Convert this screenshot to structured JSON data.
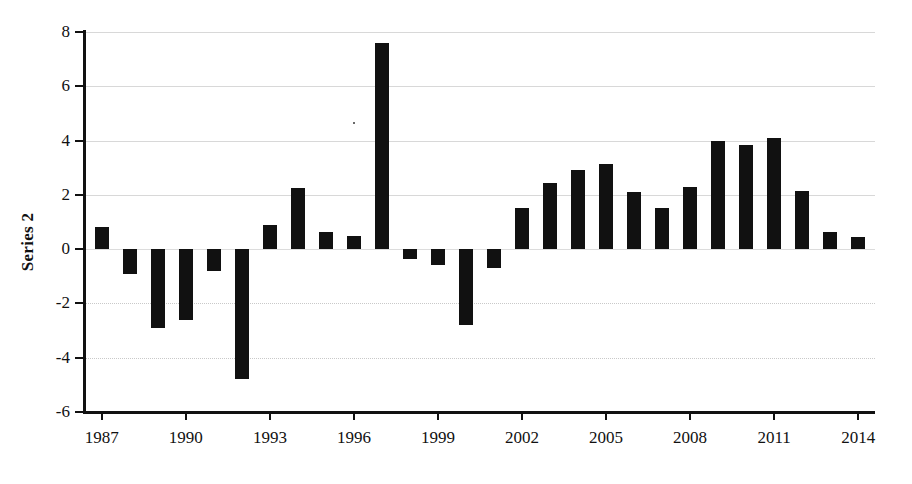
{
  "chart_data": {
    "type": "bar",
    "title": "",
    "xlabel": "",
    "ylabel": "Series 2",
    "ylim": [
      -6,
      8
    ],
    "xlim": [
      1986.4,
      2014.6
    ],
    "grid": true,
    "legend": "none",
    "yticks": [
      8,
      6,
      4,
      2,
      0,
      -2,
      -4,
      -6
    ],
    "ytick_labels": [
      "8",
      "6",
      "4",
      "2",
      "0",
      "-2",
      "-4",
      "-6"
    ],
    "xticks": [
      1987,
      1990,
      1993,
      1996,
      1999,
      2002,
      2005,
      2008,
      2011,
      2014
    ],
    "xtick_labels": [
      "1987",
      "1990",
      "1993",
      "1996",
      "1999",
      "2002",
      "2005",
      "2008",
      "2011",
      "2014"
    ],
    "bar_color": "#111111",
    "categories": [
      1987,
      1988,
      1989,
      1990,
      1991,
      1992,
      1993,
      1994,
      1995,
      1996,
      1997,
      1998,
      1999,
      2000,
      2001,
      2002,
      2003,
      2004,
      2005,
      2006,
      2007,
      2008,
      2009,
      2010,
      2011,
      2012,
      2013,
      2014
    ],
    "values": [
      0.8,
      -0.9,
      -2.9,
      -2.6,
      -0.8,
      -4.8,
      0.9,
      2.25,
      0.65,
      0.5,
      7.6,
      -0.35,
      -0.6,
      -2.8,
      -0.7,
      1.5,
      2.45,
      2.9,
      3.15,
      2.1,
      1.5,
      2.3,
      4.0,
      3.85,
      4.1,
      2.15,
      0.65,
      0.45
    ]
  },
  "axis": {
    "y_title": "Series 2"
  }
}
